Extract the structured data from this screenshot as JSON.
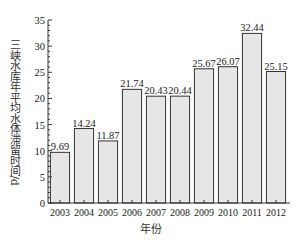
{
  "chart_data": {
    "type": "bar",
    "title": "",
    "xlabel": "年份",
    "ylabel": "三峡水库年平均水体滞留时间/d",
    "categories": [
      "2003",
      "2004",
      "2005",
      "2006",
      "2007",
      "2008",
      "2009",
      "2010",
      "2011",
      "2012"
    ],
    "values": [
      9.69,
      14.24,
      11.87,
      21.74,
      20.43,
      20.44,
      25.67,
      26.07,
      32.44,
      25.15
    ],
    "value_labels": [
      "9.69",
      "14.24",
      "11.87",
      "21.74",
      "20.43",
      "20.44",
      "25.67",
      "26.07",
      "32.44",
      "25.15"
    ],
    "ylim": [
      0,
      35
    ],
    "yticks": [
      0,
      5,
      10,
      15,
      20,
      25,
      30,
      35
    ],
    "grid": false,
    "legend": null,
    "bar_color": "#e6e6e6",
    "edge_color": "#333333"
  }
}
